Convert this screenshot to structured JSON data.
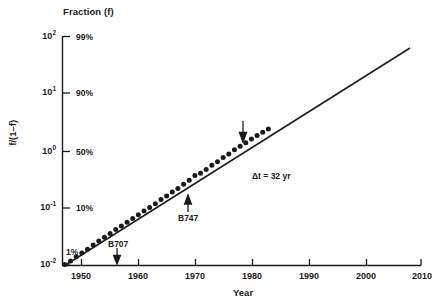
{
  "chart_data": {
    "type": "scatter",
    "title": "Fraction (f)",
    "xlabel": "Year",
    "ylabel": "f/(1–f)",
    "yscale": "log",
    "xlim": [
      1946,
      2010
    ],
    "ylim": [
      0.01,
      100
    ],
    "grid": false,
    "legend": null,
    "y_ticks_left": [
      {
        "label": "10",
        "exp": "2",
        "value": 100
      },
      {
        "label": "10",
        "exp": "1",
        "value": 10
      },
      {
        "label": "10",
        "exp": "0",
        "value": 1
      },
      {
        "label": "10",
        "exp": "-1",
        "value": 0.1
      },
      {
        "label": "10",
        "exp": "-2",
        "value": 0.01
      }
    ],
    "y_ticks_right": [
      {
        "label": "99%",
        "value": 100
      },
      {
        "label": "90%",
        "value": 10
      },
      {
        "label": "50%",
        "value": 1
      },
      {
        "label": "10%",
        "value": 0.1
      },
      {
        "label": "1%",
        "value": 0.01
      }
    ],
    "x_ticks": [
      1950,
      1960,
      1970,
      1980,
      1990,
      2000,
      2010
    ],
    "series": [
      {
        "name": "data",
        "marker": "filled-circle",
        "x": [
          1947,
          1948,
          1949,
          1950,
          1951,
          1952,
          1953,
          1954,
          1955,
          1956,
          1957,
          1958,
          1959,
          1960,
          1961,
          1962,
          1963,
          1964,
          1965,
          1966,
          1967,
          1968,
          1969,
          1970,
          1971,
          1972,
          1973,
          1974,
          1975,
          1976,
          1977,
          1978,
          1979,
          1980,
          1981,
          1982,
          1983
        ],
        "y": [
          0.0102,
          0.0118,
          0.014,
          0.0163,
          0.0188,
          0.0225,
          0.0262,
          0.0305,
          0.0355,
          0.042,
          0.048,
          0.056,
          0.065,
          0.076,
          0.088,
          0.102,
          0.118,
          0.14,
          0.162,
          0.19,
          0.218,
          0.26,
          0.305,
          0.37,
          0.405,
          0.47,
          0.56,
          0.64,
          0.76,
          0.88,
          1.04,
          1.2,
          1.38,
          1.6,
          1.85,
          2.1,
          2.4
        ]
      }
    ],
    "fit_line": {
      "name": "log-linear fit",
      "x_start": 1946.6,
      "y_start": 0.0097,
      "x_end": 2008.5,
      "y_end": 80.0
    },
    "annotations": [
      {
        "id": "b707",
        "text": "B707",
        "year": 1958,
        "arrow": "down"
      },
      {
        "id": "b747",
        "text": "B747",
        "year": 1970,
        "arrow": "up"
      },
      {
        "id": "delta-t",
        "text": "Δt  =  32 yr",
        "arrow": "none"
      },
      {
        "id": "unlabeled-marker",
        "text": "",
        "year": 1979,
        "arrow": "down"
      }
    ]
  },
  "figure": {
    "title": "Fraction (f)",
    "xlabel": "Year",
    "ylabel": "f/(1–f)",
    "delta_t_label": "Δt  =  32 yr",
    "b707_label": "B707",
    "b747_label": "B747",
    "colors": {
      "ink": "#111111",
      "background": "#ffffff"
    }
  }
}
